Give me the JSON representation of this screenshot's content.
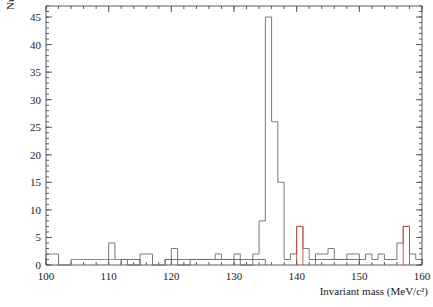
{
  "figure": {
    "background_color": "#ffffff",
    "frame_color": "#5a5a5a"
  },
  "chart_data": {
    "type": "bar",
    "title": "",
    "subtitle": "",
    "xlabel": "Invariant mass (MeV/c²)",
    "ylabel": "Number of events",
    "xlim": [
      100,
      160
    ],
    "ylim": [
      0,
      47
    ],
    "grid": false,
    "legend": null,
    "bin_width": 1,
    "x_ticks": [
      100,
      110,
      120,
      130,
      140,
      150,
      160
    ],
    "x_tick_labels": [
      "100",
      "110",
      "120",
      "130",
      "140",
      "150",
      "160"
    ],
    "x_minor_tick_step": 2,
    "y_ticks": [
      0,
      5,
      10,
      15,
      20,
      25,
      30,
      35,
      40,
      45
    ],
    "y_tick_labels": [
      "0",
      "5",
      "10",
      "15",
      "20",
      "25",
      "30",
      "35",
      "40",
      "45"
    ],
    "y_minor_tick_step": 1,
    "series": [
      {
        "name": "data",
        "color": "#6b6b6b",
        "categories": [
          100,
          101,
          102,
          103,
          104,
          105,
          106,
          107,
          108,
          109,
          110,
          111,
          112,
          113,
          114,
          115,
          116,
          117,
          118,
          119,
          120,
          121,
          122,
          123,
          124,
          125,
          126,
          127,
          128,
          129,
          130,
          131,
          132,
          133,
          134,
          135,
          136,
          137,
          138,
          139,
          140,
          141,
          142,
          143,
          144,
          145,
          146,
          147,
          148,
          149,
          150,
          151,
          152,
          153,
          154,
          155,
          156,
          157,
          158,
          159
        ],
        "values": [
          2,
          2,
          0,
          0,
          1,
          1,
          1,
          1,
          1,
          1,
          4,
          1,
          1,
          0,
          0,
          2,
          2,
          0,
          0,
          1,
          3,
          0,
          0,
          1,
          1,
          1,
          1,
          2,
          1,
          1,
          2,
          0,
          0,
          2,
          8,
          45,
          26,
          15,
          1,
          2,
          7,
          3,
          1,
          2,
          2,
          3,
          1,
          1,
          2,
          2,
          1,
          2,
          1,
          2,
          1,
          1,
          4,
          7,
          2,
          1
        ]
      },
      {
        "name": "overlay-green",
        "color": "#63b063",
        "categories": [
          104,
          105,
          106,
          107,
          108,
          109,
          110,
          111
        ],
        "values": [
          1,
          1,
          1,
          1,
          1,
          1,
          1,
          1
        ]
      },
      {
        "name": "overlay-blue",
        "color": "#5b5bc9",
        "categories": [
          112,
          113,
          114,
          119,
          120,
          121,
          122,
          123,
          124,
          125,
          126,
          127,
          128,
          129,
          130,
          131,
          132,
          133,
          134,
          143,
          144,
          145,
          146,
          147,
          148,
          149
        ],
        "values": [
          1,
          1,
          1,
          1,
          1,
          1,
          1,
          1,
          1,
          1,
          1,
          1,
          1,
          1,
          1,
          1,
          1,
          1,
          1,
          1,
          1,
          1,
          1,
          1,
          1,
          1
        ]
      },
      {
        "name": "overlay-red",
        "color": "#c74a3a",
        "categories": [
          140,
          157
        ],
        "values": [
          7,
          7
        ]
      }
    ]
  }
}
